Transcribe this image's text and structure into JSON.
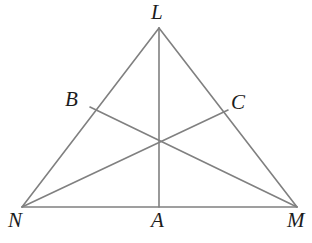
{
  "figure": {
    "type": "geometry-diagram",
    "background_color": "#ffffff",
    "line_color": "#808080",
    "label_color": "#1c1c1c",
    "stroke_width": 1.6,
    "width": 312,
    "height": 243
  },
  "points": {
    "L": {
      "label": "L",
      "x": 159,
      "y": 28
    },
    "N": {
      "label": "N",
      "x": 22,
      "y": 207
    },
    "M": {
      "label": "M",
      "x": 297,
      "y": 207
    },
    "A": {
      "label": "A",
      "x": 159,
      "y": 207
    },
    "B": {
      "label": "B",
      "x": 90,
      "y": 107
    },
    "C": {
      "label": "C",
      "x": 228,
      "y": 110
    },
    "centroid": {
      "label": "",
      "x": 159,
      "y": 140
    }
  },
  "segments": [
    {
      "name": "side-LN",
      "from": "L",
      "to": "N"
    },
    {
      "name": "side-LM",
      "from": "L",
      "to": "M"
    },
    {
      "name": "side-NM",
      "from": "N",
      "to": "M"
    },
    {
      "name": "median-LA",
      "from": "L",
      "to": "A"
    },
    {
      "name": "median-NC",
      "from": "N",
      "to": "C"
    },
    {
      "name": "median-MB",
      "from": "M",
      "to": "B"
    }
  ],
  "labels": {
    "L": "L",
    "B": "B",
    "C": "C",
    "N": "N",
    "A": "A",
    "M": "M"
  }
}
